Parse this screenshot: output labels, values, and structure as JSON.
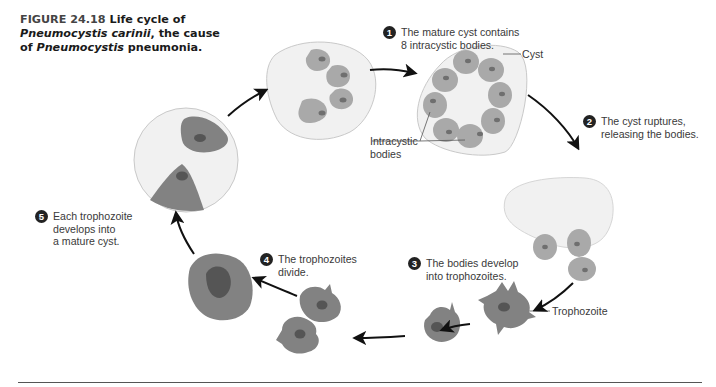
{
  "caption": {
    "figure_label": "FIGURE 24.18",
    "line1_rest": " Life cycle of",
    "organism": "Pneumocystis carinii",
    "line2_rest": ", the cause",
    "line3_of": "of ",
    "genus": "Pneumocystis",
    "line3_rest": " pneumonia."
  },
  "steps": [
    {
      "number": "1",
      "line1": "The mature cyst contains",
      "line2": "8 intracystic bodies."
    },
    {
      "number": "2",
      "line1": "The cyst ruptures,",
      "line2": "releasing the bodies."
    },
    {
      "number": "3",
      "line1": "The bodies develop",
      "line2": "into trophozoites."
    },
    {
      "number": "4",
      "line1": "The trophozoites",
      "line2": "divide."
    },
    {
      "number": "5",
      "line1": "Each trophozoite",
      "line2": "develops into",
      "line3": "a mature cyst."
    }
  ],
  "labels": {
    "cyst": "Cyst",
    "intracystic_line1": "Intracystic",
    "intracystic_line2": "bodies",
    "trophozoite": "Trophozoite"
  },
  "colors": {
    "cyst_fill": "#f1f1f1",
    "cyst_stroke": "#c9c9c9",
    "body_fill": "#a9a9a9",
    "body_nucleus": "#6f6f6f",
    "trophozoite_fill": "#828282",
    "trophozoite_nucleus": "#555555",
    "arrow": "#111111",
    "step_badge": "#222222"
  }
}
